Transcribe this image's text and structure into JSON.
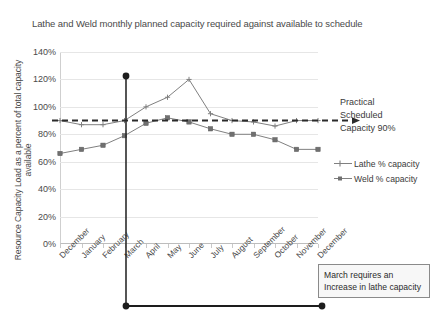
{
  "chart_data": {
    "type": "line",
    "title": "Lathe and Weld monthly planned capacity required against available to schedule",
    "xlabel": "",
    "ylabel": "Resource Capacity Load as a percent of total capacity available",
    "categories": [
      "December",
      "January",
      "February",
      "March",
      "April",
      "May",
      "June",
      "July",
      "August",
      "September",
      "October",
      "November",
      "December"
    ],
    "series": [
      {
        "name": "Lathe % capacity",
        "values": [
          90,
          87,
          87,
          90,
          100,
          107,
          120,
          95,
          90,
          89,
          86,
          90,
          90
        ],
        "marker": "cross",
        "color": "#808080"
      },
      {
        "name": "Weld % capacity",
        "values": [
          66,
          69,
          72,
          79,
          88,
          92,
          89,
          84,
          80,
          80,
          76,
          69,
          69
        ],
        "marker": "square",
        "color": "#808080"
      }
    ],
    "ylim": [
      0,
      140
    ],
    "yticks": [
      0,
      20,
      40,
      60,
      80,
      100,
      120,
      140
    ],
    "ytick_labels": [
      "0%",
      "20%",
      "40%",
      "60%",
      "80%",
      "100%",
      "120%",
      "140%"
    ],
    "grid": true,
    "legend_position": "right",
    "reference_line": {
      "label": "Practical Scheduled Capacity 90%",
      "value": 90,
      "style": "dashed",
      "color": "#2b2b2b"
    },
    "annotations": [
      {
        "name": "march-marker",
        "label": "March requires an Increase in lathe capacity",
        "category": "March",
        "value": 120
      }
    ]
  },
  "title": "Lathe and Weld monthly planned capacity required against available to schedule",
  "yaxis": {
    "label": "Resource Capacity Load as a percent of total capacity available",
    "ticks": [
      "140%",
      "120%",
      "100%",
      "80%",
      "60%",
      "40%",
      "20%",
      "0%"
    ]
  },
  "xaxis": {
    "labels": [
      "December",
      "January",
      "February",
      "March",
      "April",
      "May",
      "June",
      "July",
      "August",
      "September",
      "October",
      "November",
      "December"
    ]
  },
  "practical_line": {
    "line1": "Practical",
    "line2": "Scheduled",
    "line3": "Capacity 90%"
  },
  "legend": {
    "items": [
      {
        "label": "Lathe % capacity"
      },
      {
        "label": "Weld % capacity"
      }
    ]
  },
  "note": {
    "line1": "March requires an",
    "line2": "Increase in lathe capacity"
  },
  "colors": {
    "series": "#808080",
    "reference": "#2b2b2b",
    "grid": "#e6e6e6",
    "text": "#3a3a3a",
    "note_border": "#8a8a8a"
  }
}
